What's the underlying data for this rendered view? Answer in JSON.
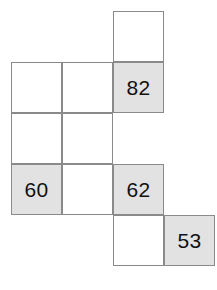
{
  "puzzle": {
    "type": "number-grid-polyomino",
    "grid": {
      "columns": 4,
      "rows": 5,
      "cell_size_px": 51,
      "origin_x_px": 11,
      "origin_y_px": 11
    },
    "colors": {
      "background": "#ffffff",
      "cell_fill_empty": "#ffffff",
      "cell_fill_shaded": "#e2e2e2",
      "cell_border": "#8a8a8a",
      "text": "#111111"
    },
    "cells": [
      {
        "id": "cell-r0c2",
        "row": 0,
        "col": 2,
        "shaded": false,
        "value": ""
      },
      {
        "id": "cell-r1c0",
        "row": 1,
        "col": 0,
        "shaded": false,
        "value": ""
      },
      {
        "id": "cell-r1c1",
        "row": 1,
        "col": 1,
        "shaded": false,
        "value": ""
      },
      {
        "id": "cell-r1c2",
        "row": 1,
        "col": 2,
        "shaded": true,
        "value": "82"
      },
      {
        "id": "cell-r2c0",
        "row": 2,
        "col": 0,
        "shaded": false,
        "value": ""
      },
      {
        "id": "cell-r2c1",
        "row": 2,
        "col": 1,
        "shaded": false,
        "value": ""
      },
      {
        "id": "cell-r3c0",
        "row": 3,
        "col": 0,
        "shaded": true,
        "value": "60"
      },
      {
        "id": "cell-r3c1",
        "row": 3,
        "col": 1,
        "shaded": false,
        "value": ""
      },
      {
        "id": "cell-r3c2",
        "row": 3,
        "col": 2,
        "shaded": true,
        "value": "62"
      },
      {
        "id": "cell-r4c2",
        "row": 4,
        "col": 2,
        "shaded": false,
        "value": ""
      },
      {
        "id": "cell-r4c3",
        "row": 4,
        "col": 3,
        "shaded": true,
        "value": "53"
      }
    ],
    "visible_numbers": [
      "82",
      "60",
      "62",
      "53"
    ]
  }
}
